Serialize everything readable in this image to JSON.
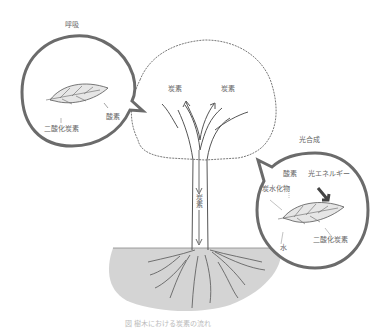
{
  "diagram": {
    "type": "tree-carbon-cycle",
    "colors": {
      "bubble_stroke": "#6b6b6b",
      "leaf_fill": "#e6e6e6",
      "soil_fill": "#d4d4d4",
      "text": "#666666"
    },
    "respiration_bubble": {
      "title": "呼吸",
      "labels": {
        "co2": "二酸化炭素",
        "oxygen": "酸素"
      }
    },
    "tree": {
      "crown_labels": [
        "炭素",
        "炭素"
      ],
      "trunk_label": "炭素"
    },
    "photosynthesis_bubble": {
      "title": "光合成",
      "labels": {
        "oxygen": "酸素",
        "light_energy": "光エネルギー",
        "carbohydrate": "炭水化物",
        "water": "水",
        "co2": "二酸化炭素"
      }
    },
    "caption": "図 樹木における炭素の流れ"
  }
}
